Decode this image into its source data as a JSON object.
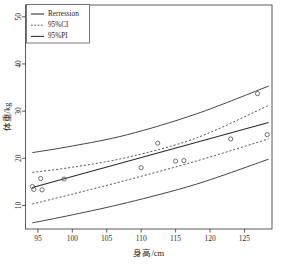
{
  "chart_data": {
    "type": "scatter",
    "title": "",
    "subtitle": "",
    "xlabel": "身高/cm",
    "ylabel": "体重/kg",
    "xlim": [
      93.2,
      129.0
    ],
    "ylim": [
      5.0,
      52.5
    ],
    "xticks": [
      95,
      100,
      105,
      110,
      115,
      120,
      125
    ],
    "yticks": [
      10,
      20,
      30,
      40,
      50
    ],
    "xtick_labels": [
      "95",
      "100",
      "105",
      "110",
      "115",
      "120",
      "125"
    ],
    "ytick_labels": [
      "10",
      "20",
      "30",
      "40",
      "50"
    ],
    "grid": false,
    "legend_position": "top-left",
    "legend_entries": [
      {
        "label": "Rerression",
        "style": "solid"
      },
      {
        "label": "95%CI",
        "style": "dashed"
      },
      {
        "label": "95%PI",
        "style": "solid"
      }
    ],
    "points": [
      {
        "x": 94.2,
        "y": 14.0
      },
      {
        "x": 94.4,
        "y": 13.4
      },
      {
        "x": 95.4,
        "y": 15.7
      },
      {
        "x": 95.6,
        "y": 13.3
      },
      {
        "x": 98.8,
        "y": 15.6
      },
      {
        "x": 110.0,
        "y": 18.0
      },
      {
        "x": 112.4,
        "y": 23.2
      },
      {
        "x": 115.0,
        "y": 19.4
      },
      {
        "x": 116.2,
        "y": 19.5
      },
      {
        "x": 123.0,
        "y": 24.1
      },
      {
        "x": 126.9,
        "y": 33.7
      },
      {
        "x": 128.3,
        "y": 25.0
      }
    ],
    "series": [
      {
        "name": "Rerression",
        "style": "solid",
        "x": [
          94.2,
          128.5
        ],
        "values": [
          13.8,
          27.6
        ]
      },
      {
        "name": "95%CI upper",
        "style": "dashed",
        "x": [
          94.2,
          100.0,
          108.0,
          118.0,
          128.5
        ],
        "values": [
          17.0,
          18.1,
          20.2,
          24.3,
          31.2
        ]
      },
      {
        "name": "95%CI lower",
        "style": "dashed",
        "x": [
          94.2,
          100.0,
          108.0,
          118.0,
          128.5
        ],
        "values": [
          10.3,
          12.4,
          15.4,
          19.4,
          24.1
        ]
      },
      {
        "name": "95%PI upper",
        "style": "solid",
        "x": [
          94.2,
          100.0,
          108.0,
          118.0,
          128.5
        ],
        "values": [
          21.2,
          22.6,
          25.0,
          29.4,
          35.3
        ]
      },
      {
        "name": "95%PI lower",
        "style": "solid",
        "x": [
          94.2,
          100.0,
          108.0,
          118.0,
          128.5
        ],
        "values": [
          6.3,
          8.0,
          10.6,
          14.5,
          19.8
        ]
      }
    ]
  }
}
